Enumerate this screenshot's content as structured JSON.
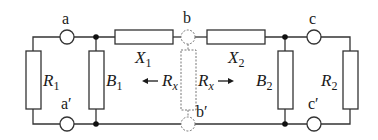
{
  "diagram": {
    "type": "circuit",
    "colors": {
      "wire": "#333333",
      "component_fill": "#ffffff",
      "dashed": "#777777",
      "text": "#1a1a1a"
    },
    "terminals": {
      "a": "a",
      "a_prime": "a′",
      "b": "b",
      "b_prime": "b′",
      "c": "c",
      "c_prime": "c′"
    },
    "components": {
      "R1": {
        "main": "R",
        "sub": "1"
      },
      "B1": {
        "main": "B",
        "sub": "1"
      },
      "X1": {
        "main": "X",
        "sub": "1"
      },
      "X2": {
        "main": "X",
        "sub": "2"
      },
      "B2": {
        "main": "B",
        "sub": "2"
      },
      "R2": {
        "main": "R",
        "sub": "2"
      },
      "Rx_left": {
        "main": "R",
        "sub": "x",
        "arrow": "←"
      },
      "Rx_right": {
        "main": "R",
        "sub": "x",
        "arrow": "→"
      }
    }
  }
}
